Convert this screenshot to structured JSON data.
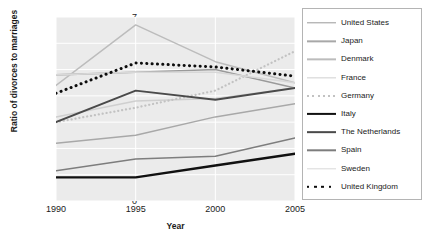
{
  "chart_data": {
    "type": "line",
    "title": "",
    "xlabel": "Year",
    "ylabel": "Ratio of divorces to marriages",
    "x": [
      1990,
      1995,
      2000,
      2005
    ],
    "xlim": [
      1990,
      2005
    ],
    "ylim": [
      0,
      0.7
    ],
    "xticks": [
      "1990",
      "1995",
      "2000",
      "2005"
    ],
    "yticks": [
      "0",
      ".1",
      ".2",
      ".3",
      ".4",
      ".5",
      ".6",
      ".7"
    ],
    "ytick_values": [
      0,
      0.1,
      0.2,
      0.3,
      0.4,
      0.5,
      0.6,
      0.7
    ],
    "grid": true,
    "legend_position": "right",
    "plot_background": "#ebebeb",
    "series": [
      {
        "name": "United States",
        "values": [
          0.48,
          0.49,
          0.5,
          0.43
        ],
        "color": "#9a9a9a",
        "style": "solid",
        "width": 1.6
      },
      {
        "name": "Japan",
        "values": [
          0.22,
          0.25,
          0.32,
          0.37
        ],
        "color": "#a8a8a8",
        "style": "solid",
        "width": 1.5
      },
      {
        "name": "Denmark",
        "values": [
          0.44,
          0.67,
          0.53,
          0.45
        ],
        "color": "#bcbcbc",
        "style": "solid",
        "width": 1.5
      },
      {
        "name": "France",
        "values": [
          0.32,
          0.38,
          0.39,
          0.43
        ],
        "color": "#cfcfcf",
        "style": "solid",
        "width": 1.5
      },
      {
        "name": "Germany",
        "values": [
          0.3,
          0.355,
          0.42,
          0.57
        ],
        "color": "#c2c2c2",
        "style": "dotted",
        "width": 2.2
      },
      {
        "name": "Italy",
        "values": [
          0.09,
          0.09,
          0.135,
          0.18
        ],
        "color": "#111111",
        "style": "solid",
        "width": 2.4
      },
      {
        "name": "The Netherlands",
        "values": [
          0.3,
          0.42,
          0.385,
          0.43
        ],
        "color": "#4a4a4a",
        "style": "solid",
        "width": 1.9
      },
      {
        "name": "Spain",
        "values": [
          0.115,
          0.16,
          0.17,
          0.24
        ],
        "color": "#7d7d7d",
        "style": "solid",
        "width": 1.6
      },
      {
        "name": "Sweden",
        "values": [
          0.48,
          0.49,
          0.49,
          0.45
        ],
        "color": "#d8d8d8",
        "style": "solid",
        "width": 1.6
      },
      {
        "name": "United Kingdom",
        "values": [
          0.41,
          0.525,
          0.51,
          0.475
        ],
        "color": "#0d0d0d",
        "style": "dotted",
        "width": 3.0
      }
    ]
  },
  "axis": {
    "y_title": "Ratio of divorces to marriages",
    "x_title": "Year",
    "y_labels": [
      "0",
      ".1",
      ".2",
      ".3",
      ".4",
      ".5",
      ".6",
      ".7"
    ],
    "x_labels": [
      "1990",
      "1995",
      "2000",
      "2005"
    ]
  },
  "legend": {
    "items": [
      {
        "label": "United States"
      },
      {
        "label": "Japan"
      },
      {
        "label": "Denmark"
      },
      {
        "label": "France"
      },
      {
        "label": "Germany"
      },
      {
        "label": "Italy"
      },
      {
        "label": "The Netherlands"
      },
      {
        "label": "Spain"
      },
      {
        "label": "Sweden"
      },
      {
        "label": "United Kingdom"
      }
    ]
  }
}
